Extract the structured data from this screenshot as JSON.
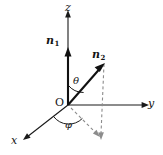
{
  "figure": {
    "background_color": "#ffffff",
    "width": 163,
    "height": 155,
    "colors": {
      "axis": "#1a1a1a",
      "vector": "#111111",
      "dashed": "#8c8c8c",
      "text": "#141414"
    }
  },
  "axes": [
    {
      "id": "z",
      "label": "z",
      "direction": "up",
      "label_x": 66,
      "label_y": 2
    },
    {
      "id": "y",
      "label": "y",
      "direction": "right",
      "label_x": 148,
      "label_y": 99
    },
    {
      "id": "x",
      "label": "x",
      "direction": "down-left",
      "label_x": 11,
      "label_y": 136
    }
  ],
  "origin": {
    "label": "O",
    "label_x": 56,
    "label_y": 98,
    "point_x": 68,
    "point_y": 105
  },
  "vectors": [
    {
      "id": "n1",
      "name": "n",
      "subscript": "1",
      "label_x": 47,
      "label_y": 36,
      "from_x": 68,
      "from_y": 105,
      "to_x": 68,
      "to_y": 48
    },
    {
      "id": "n2",
      "name": "n",
      "subscript": "2",
      "label_x": 92,
      "label_y": 50,
      "from_x": 68,
      "from_y": 105,
      "to_x": 104,
      "to_y": 64
    }
  ],
  "angles": [
    {
      "id": "theta",
      "label": "θ",
      "label_x": 73,
      "label_y": 77,
      "between": "z-axis and n2"
    },
    {
      "id": "phi",
      "label": "φ",
      "label_x": 66,
      "label_y": 121,
      "between": "x-axis and projection of n2"
    }
  ],
  "projection_lines": [
    {
      "id": "vertical-drop",
      "style": "dashed",
      "from_x": 104,
      "from_y": 64,
      "to_x": 101,
      "to_y": 139
    },
    {
      "id": "ground-projection",
      "style": "dashed",
      "from_x": 68,
      "from_y": 105,
      "to_x": 100,
      "to_y": 137
    }
  ]
}
